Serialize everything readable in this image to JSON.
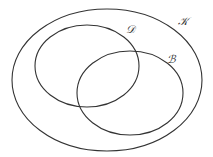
{
  "diagram": {
    "type": "venn",
    "stroke_color": "#333333",
    "background": "#ffffff",
    "sets": [
      {
        "id": "K",
        "label": "𝒦",
        "role": "universe",
        "ellipse": {
          "cx": 107,
          "cy": 80,
          "rx": 95,
          "ry": 71
        },
        "label_pos": {
          "x": 178,
          "y": 16
        }
      },
      {
        "id": "D",
        "label": "𝒟",
        "role": "subset",
        "ellipse": {
          "cx": 87,
          "cy": 66,
          "rx": 52,
          "ry": 41
        },
        "label_pos": {
          "x": 126,
          "y": 24
        }
      },
      {
        "id": "B",
        "label": "ℬ",
        "role": "subset",
        "ellipse": {
          "cx": 130,
          "cy": 93,
          "rx": 53,
          "ry": 42
        },
        "label_pos": {
          "x": 167,
          "y": 54
        }
      }
    ],
    "relations": [
      "D ⊂ K",
      "B ⊂ K",
      "D ∩ B ≠ ∅"
    ]
  }
}
